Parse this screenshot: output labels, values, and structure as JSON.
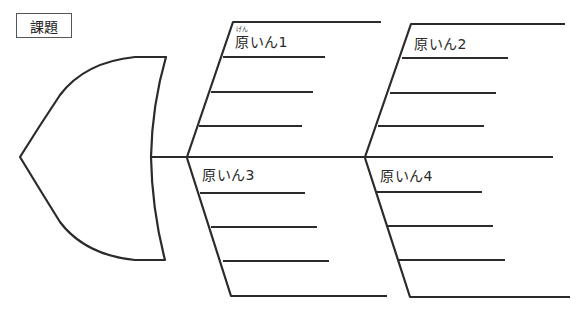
{
  "diagram": {
    "type": "fishbone",
    "problem_label": "課題",
    "causes": [
      {
        "label": "原いん1",
        "furigana": "げん",
        "position": "top-left"
      },
      {
        "label": "原いん2",
        "position": "top-right"
      },
      {
        "label": "原いん3",
        "position": "bottom-left"
      },
      {
        "label": "原いん4",
        "position": "bottom-right"
      }
    ],
    "sub_lines_per_cause": 3,
    "colors": {
      "line": "#2b2b2b",
      "background": "#ffffff"
    }
  }
}
